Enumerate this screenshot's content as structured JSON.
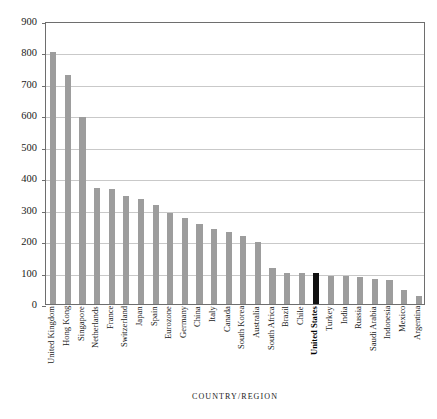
{
  "chart_data": {
    "type": "bar",
    "title": "",
    "xlabel": "COUNTRY/REGION",
    "ylabel": "PERCENT OF GDP",
    "ylim": [
      0,
      900
    ],
    "ytick_labels": [
      "0",
      "100",
      "200",
      "300",
      "400",
      "500",
      "600",
      "700",
      "800",
      "900"
    ],
    "ytick_values": [
      0,
      100,
      200,
      300,
      400,
      500,
      600,
      700,
      800,
      900
    ],
    "grid": true,
    "legend": "none",
    "highlight_category": "United States",
    "colors": {
      "bar": "#9d9d9d",
      "highlight_bar": "#111111",
      "gridline": "#c9c9c9",
      "axis": "#6e6e6e",
      "background": "#ffffff",
      "text": "#1a1a1a"
    },
    "categories": [
      "United Kingdom",
      "Hong Kong",
      "Singapore",
      "Netherlands",
      "France",
      "Switzerland",
      "Japan",
      "Spain",
      "Eurozone",
      "Germany",
      "China",
      "Italy",
      "Canada",
      "South Korea",
      "Australia",
      "South Africa",
      "Brazil",
      "Chile",
      "United States",
      "Turkey",
      "India",
      "Russia",
      "Saudi Arabia",
      "Indonesia",
      "Mexico",
      "Argentina"
    ],
    "values": [
      800,
      727,
      595,
      370,
      365,
      345,
      333,
      315,
      290,
      275,
      255,
      240,
      230,
      215,
      198,
      115,
      100,
      100,
      100,
      90,
      88,
      85,
      80,
      75,
      45,
      25
    ]
  }
}
